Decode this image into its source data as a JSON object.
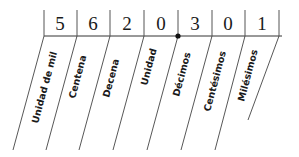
{
  "diagram": {
    "digits": [
      "5",
      "6",
      "2",
      "0",
      "3",
      "0",
      "1"
    ],
    "labels": [
      "Unidad de mil",
      "Centena",
      "Decena",
      "Unidad",
      "Décimos",
      "Centésimos",
      "Milésimos"
    ],
    "decimal_point_after_index": 3,
    "colors": {
      "line": "#333333",
      "text": "#1a1a1a",
      "background": "#ffffff"
    }
  }
}
